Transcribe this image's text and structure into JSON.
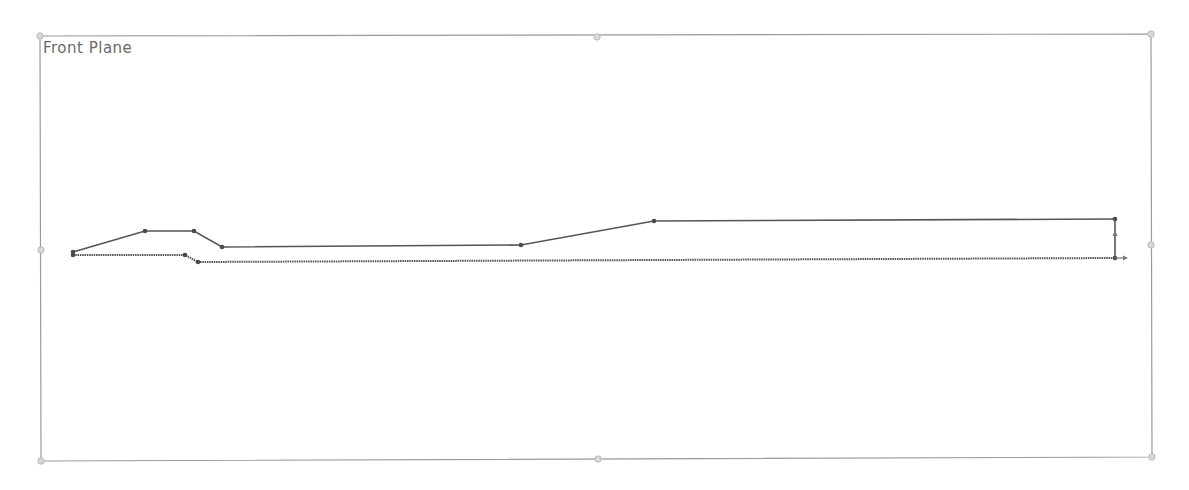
{
  "plane": {
    "label": "Front Plane",
    "border_color": "#9a9a9a",
    "bounds": {
      "x1": 40,
      "y1": 36,
      "x2": 1151,
      "y2": 461
    },
    "handles": [
      {
        "name": "corner-top-left",
        "x": 40,
        "y": 36
      },
      {
        "name": "edge-top-mid",
        "x": 597,
        "y": 37
      },
      {
        "name": "corner-top-right",
        "x": 1151,
        "y": 34
      },
      {
        "name": "edge-left-mid",
        "x": 41,
        "y": 250
      },
      {
        "name": "edge-right-mid",
        "x": 1151,
        "y": 245
      },
      {
        "name": "corner-bottom-left",
        "x": 41,
        "y": 461
      },
      {
        "name": "edge-bottom-mid",
        "x": 598,
        "y": 459
      },
      {
        "name": "corner-bottom-right",
        "x": 1152,
        "y": 457
      }
    ]
  },
  "sketch": {
    "line_color": "#555555",
    "vertex_color": "#4a4a4a",
    "upper_profile": [
      [
        73,
        252
      ],
      [
        145,
        231
      ],
      [
        194,
        231
      ],
      [
        222,
        247
      ],
      [
        521,
        245
      ],
      [
        654,
        221
      ],
      [
        1115,
        219
      ]
    ],
    "lower_profile": [
      [
        73,
        255
      ],
      [
        185,
        255
      ],
      [
        198,
        262
      ],
      [
        1115,
        258
      ]
    ],
    "closing_segment": [
      [
        1115,
        219
      ],
      [
        1115,
        258
      ]
    ],
    "vertices": [
      [
        73,
        252
      ],
      [
        73,
        255
      ],
      [
        145,
        231
      ],
      [
        194,
        231
      ],
      [
        222,
        247
      ],
      [
        521,
        245
      ],
      [
        654,
        221
      ],
      [
        1115,
        219
      ],
      [
        185,
        255
      ],
      [
        198,
        262
      ],
      [
        1115,
        258
      ]
    ],
    "origin": {
      "x": 1115,
      "y": 258
    }
  }
}
